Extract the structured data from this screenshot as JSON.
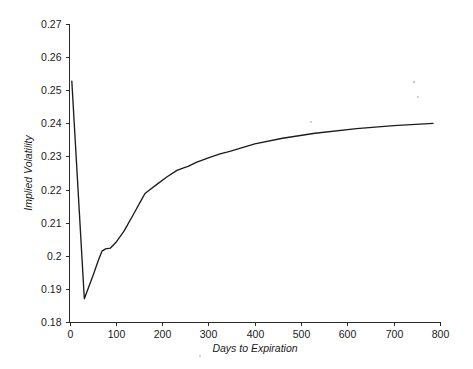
{
  "chart_data": {
    "type": "line",
    "title": "",
    "subtitle": "",
    "xlabel": "Days to Expiration",
    "ylabel": "Implied Volatility",
    "xlim": [
      0,
      800
    ],
    "ylim": [
      0.18,
      0.27
    ],
    "xticks": [
      0,
      100,
      200,
      300,
      400,
      500,
      600,
      700,
      800
    ],
    "xtick_labels": [
      "0",
      "100",
      "200",
      "300",
      "400",
      "500",
      "600",
      "700",
      "800"
    ],
    "yticks": [
      0.18,
      0.19,
      0.2,
      0.21,
      0.22,
      0.23,
      0.24,
      0.25,
      0.26,
      0.27
    ],
    "ytick_labels": [
      "0.18",
      "0.19",
      "0.2",
      "0.21",
      "0.22",
      "0.23",
      "0.24",
      "0.25",
      "0.26",
      "0.27"
    ],
    "grid": false,
    "legend": false,
    "legend_position": "none",
    "line_color": "#1c1c1c",
    "axis_color": "#2b2b2b",
    "background_color": "#ffffff",
    "series": [
      {
        "name": "Implied Volatility Term Structure",
        "x": [
          5,
          32,
          52,
          62,
          70,
          78,
          88,
          100,
          118,
          140,
          155,
          163,
          172,
          188,
          210,
          232,
          248,
          256,
          275,
          300,
          325,
          340,
          348,
          400,
          460,
          530,
          620,
          700,
          785
        ],
        "y": [
          0.2527,
          0.187,
          0.1945,
          0.1985,
          0.2014,
          0.2021,
          0.2023,
          0.204,
          0.2075,
          0.213,
          0.2168,
          0.2188,
          0.2198,
          0.2215,
          0.2238,
          0.2258,
          0.2266,
          0.227,
          0.2283,
          0.2296,
          0.2308,
          0.2313,
          0.2316,
          0.2338,
          0.2355,
          0.237,
          0.2384,
          0.2393,
          0.24
        ]
      }
    ]
  },
  "axis": {
    "y_title": "Implied Volatility",
    "x_title": "Days to Expiration"
  }
}
